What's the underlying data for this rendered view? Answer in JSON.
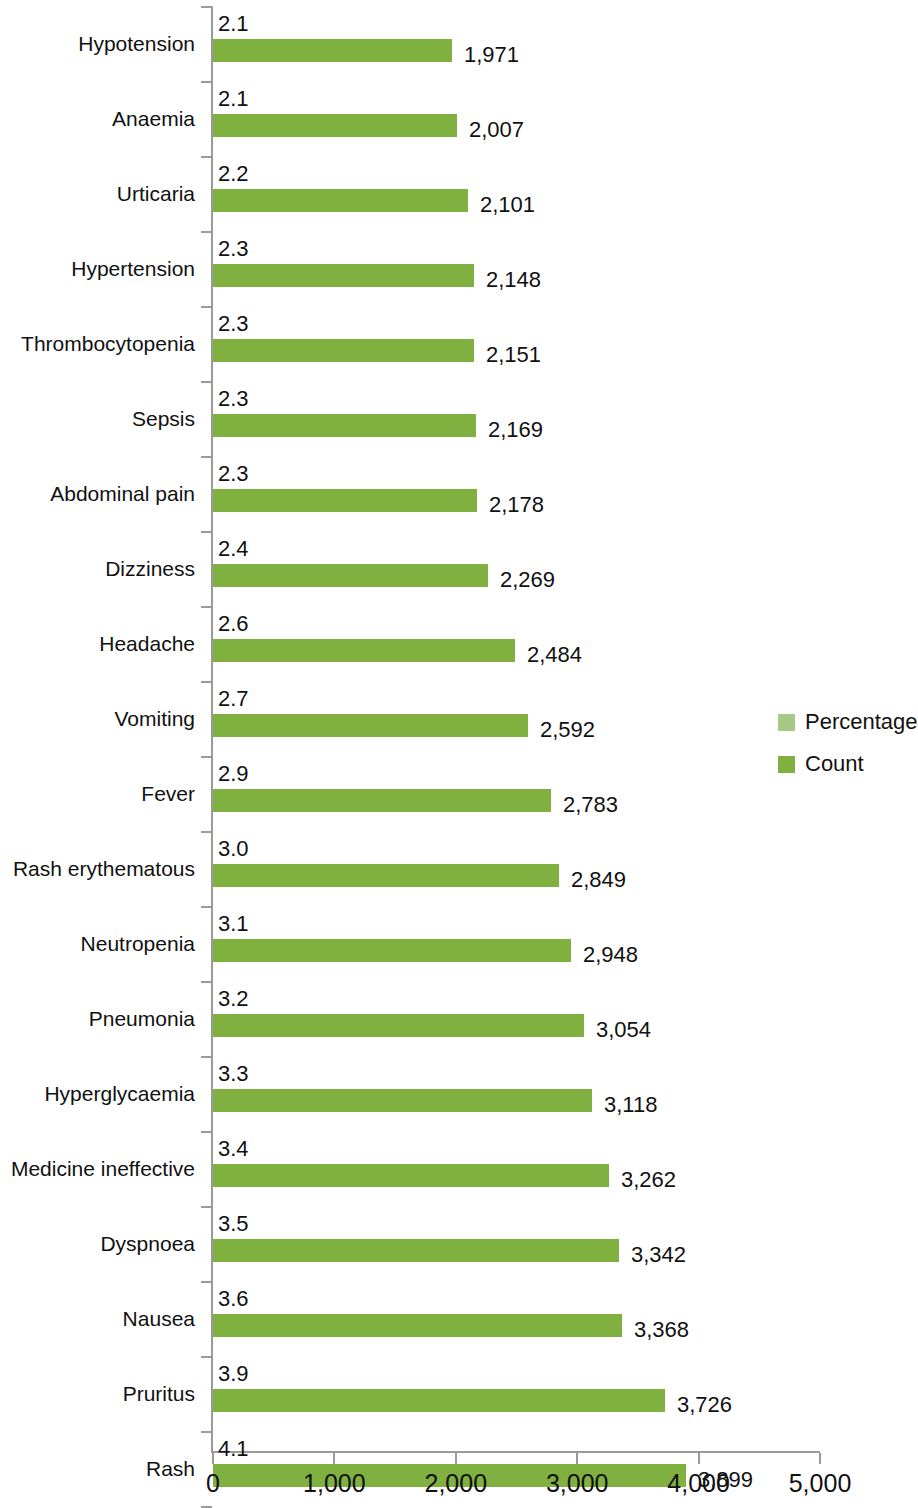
{
  "chart_data": {
    "type": "bar",
    "orientation": "horizontal",
    "title": "",
    "subtitle": "",
    "xlabel": "",
    "ylabel": "",
    "xlim": [
      0,
      5000
    ],
    "grid": false,
    "x_ticks": [
      "0",
      "1,000",
      "2,000",
      "3,000",
      "4,000",
      "5,000"
    ],
    "x_tick_values": [
      0,
      1000,
      2000,
      3000,
      4000,
      5000
    ],
    "legend_position": "right",
    "legend": [
      {
        "name": "Percentage",
        "color": "#a8c888"
      },
      {
        "name": "Count",
        "color": "#7fb040"
      }
    ],
    "categories": [
      "Hypotension",
      "Anaemia",
      "Urticaria",
      "Hypertension",
      "Thrombocytopenia",
      "Sepsis",
      "Abdominal pain",
      "Dizziness",
      "Headache",
      "Vomiting",
      "Fever",
      "Rash erythematous",
      "Neutropenia",
      "Pneumonia",
      "Hyperglycaemia",
      "Medicine ineffective",
      "Dyspnoea",
      "Nausea",
      "Pruritus",
      "Rash"
    ],
    "series": [
      {
        "name": "Count",
        "values": [
          1971,
          2007,
          2101,
          2148,
          2151,
          2169,
          2178,
          2269,
          2484,
          2592,
          2783,
          2849,
          2948,
          3054,
          3118,
          3262,
          3342,
          3368,
          3726,
          3899
        ],
        "labels": [
          "1,971",
          "2,007",
          "2,101",
          "2,148",
          "2,151",
          "2,169",
          "2,178",
          "2,269",
          "2,484",
          "2,592",
          "2,783",
          "2,849",
          "2,948",
          "3,054",
          "3,118",
          "3,262",
          "3,342",
          "3,368",
          "3,726",
          "3,899"
        ]
      },
      {
        "name": "Percentage",
        "values": [
          2.1,
          2.1,
          2.2,
          2.3,
          2.3,
          2.3,
          2.3,
          2.4,
          2.6,
          2.7,
          2.9,
          3.0,
          3.1,
          3.2,
          3.3,
          3.4,
          3.5,
          3.6,
          3.9,
          4.1
        ],
        "labels": [
          "2.1",
          "2.1",
          "2.2",
          "2.3",
          "2.3",
          "2.3",
          "2.3",
          "2.4",
          "2.6",
          "2.7",
          "2.9",
          "3.0",
          "3.1",
          "3.2",
          "3.3",
          "3.4",
          "3.5",
          "3.6",
          "3.9",
          "4.1"
        ]
      }
    ],
    "bar_color": "#7fb040",
    "axis_color": "#9a9a9a"
  }
}
